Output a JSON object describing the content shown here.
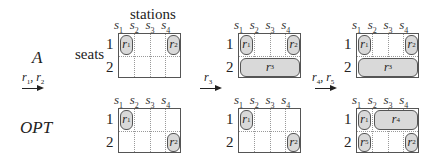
{
  "labels": {
    "stations": "stations",
    "seats": "seats",
    "row_A": "A",
    "row_OPT": "OPT"
  },
  "station_headers": [
    "s1",
    "s2",
    "s3",
    "s4"
  ],
  "seat_numbers": [
    "1",
    "2"
  ],
  "arrows": [
    {
      "label": "r1, r2"
    },
    {
      "label": "r3"
    },
    {
      "label": "r4, r5"
    }
  ],
  "grids": {
    "A": [
      {
        "requests": [
          {
            "name": "r1",
            "seat": 1,
            "from": 1,
            "to": 1
          },
          {
            "name": "r2",
            "seat": 1,
            "from": 4,
            "to": 4
          }
        ]
      },
      {
        "requests": [
          {
            "name": "r1",
            "seat": 1,
            "from": 1,
            "to": 1
          },
          {
            "name": "r2",
            "seat": 1,
            "from": 4,
            "to": 4
          },
          {
            "name": "r3",
            "seat": 2,
            "from": 1,
            "to": 4
          }
        ]
      },
      {
        "requests": [
          {
            "name": "r1",
            "seat": 1,
            "from": 1,
            "to": 1
          },
          {
            "name": "r2",
            "seat": 1,
            "from": 4,
            "to": 4
          },
          {
            "name": "r3",
            "seat": 2,
            "from": 1,
            "to": 4
          }
        ]
      }
    ],
    "OPT": [
      {
        "requests": [
          {
            "name": "r1",
            "seat": 1,
            "from": 1,
            "to": 1
          },
          {
            "name": "r2",
            "seat": 2,
            "from": 4,
            "to": 4
          }
        ]
      },
      {
        "requests": [
          {
            "name": "r1",
            "seat": 1,
            "from": 1,
            "to": 1
          },
          {
            "name": "r2",
            "seat": 2,
            "from": 4,
            "to": 4
          }
        ]
      },
      {
        "requests": [
          {
            "name": "r1",
            "seat": 1,
            "from": 1,
            "to": 1
          },
          {
            "name": "r4",
            "seat": 1,
            "from": 2,
            "to": 4
          },
          {
            "name": "r5",
            "seat": 2,
            "from": 1,
            "to": 1
          },
          {
            "name": "r2",
            "seat": 2,
            "from": 4,
            "to": 4
          }
        ]
      }
    ]
  }
}
